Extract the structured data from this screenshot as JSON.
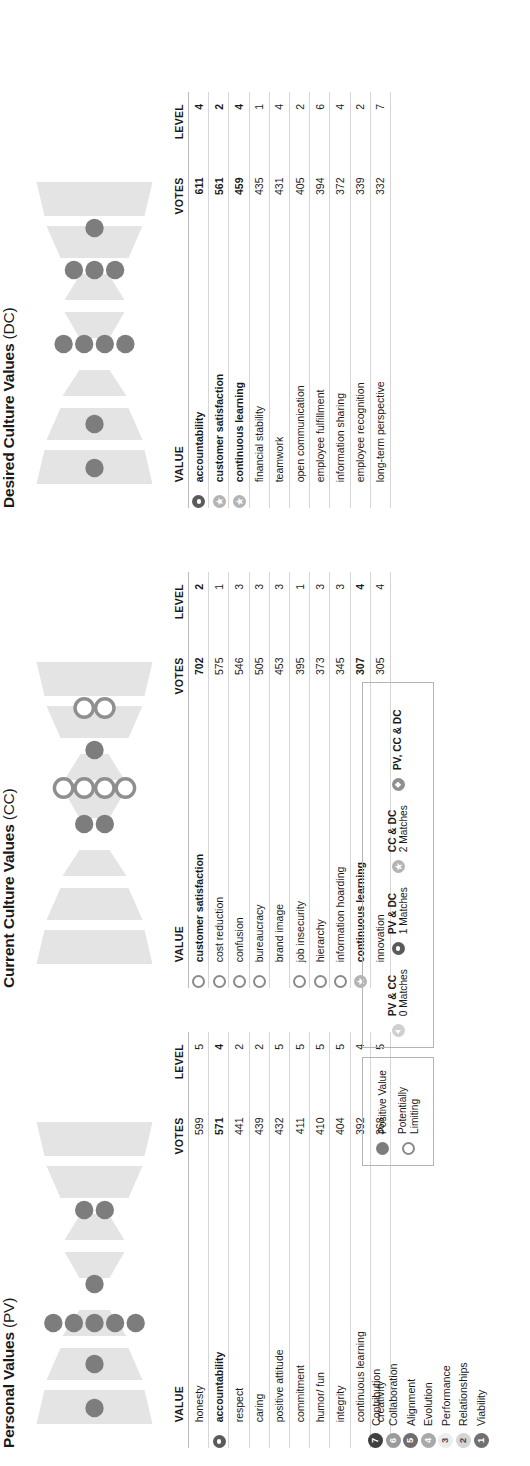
{
  "report": {
    "panels": [
      {
        "key": "pv",
        "title": "Personal Values",
        "suffix": " (PV)",
        "columns": {
          "value": "VALUE",
          "votes": "VOTES",
          "level": "LEVEL"
        },
        "rows": [
          {
            "icon": "",
            "value": "honesty",
            "votes": "599",
            "level": "5",
            "bold": false
          },
          {
            "icon": "m-pvdc",
            "value": "accountability",
            "votes": "571",
            "level": "4",
            "bold": true
          },
          {
            "icon": "",
            "value": "respect",
            "votes": "441",
            "level": "2",
            "bold": false
          },
          {
            "icon": "",
            "value": "caring",
            "votes": "439",
            "level": "2",
            "bold": false
          },
          {
            "icon": "",
            "value": "positive attitude",
            "votes": "432",
            "level": "5",
            "bold": false
          },
          {
            "icon": "",
            "value": "commitment",
            "votes": "411",
            "level": "5",
            "bold": false
          },
          {
            "icon": "",
            "value": "humor/ fun",
            "votes": "410",
            "level": "5",
            "bold": false
          },
          {
            "icon": "",
            "value": "integrity",
            "votes": "404",
            "level": "5",
            "bold": false
          },
          {
            "icon": "",
            "value": "continuous learning",
            "votes": "392",
            "level": "4",
            "bold": false
          },
          {
            "icon": "",
            "value": "creativity",
            "votes": "368",
            "level": "5",
            "bold": false
          }
        ],
        "hourglass": {
          "levels": [
            {
              "level": 7,
              "pv": 1,
              "type": "pos"
            },
            {
              "level": 6,
              "pv": 1,
              "type": "pos"
            },
            {
              "level": 5,
              "pv": 5,
              "type": "pos"
            },
            {
              "level": 4,
              "pv": 1,
              "type": "pos"
            },
            {
              "level": 3,
              "pv": 0,
              "type": "pos"
            },
            {
              "level": 2,
              "pv": 2,
              "type": "pos"
            },
            {
              "level": 1,
              "pv": 0,
              "type": "pos"
            }
          ]
        }
      },
      {
        "key": "cc",
        "title": "Current Culture Values",
        "suffix": " (CC)",
        "columns": {
          "value": "VALUE",
          "votes": "VOTES",
          "level": "LEVEL"
        },
        "rows": [
          {
            "icon": "pl",
            "value": "customer satisfaction",
            "votes": "702",
            "level": "2",
            "bold": true
          },
          {
            "icon": "pl",
            "value": "cost reduction",
            "votes": "575",
            "level": "1",
            "bold": false
          },
          {
            "icon": "pl",
            "value": "confusion",
            "votes": "546",
            "level": "3",
            "bold": false
          },
          {
            "icon": "pl",
            "value": "bureaucracy",
            "votes": "505",
            "level": "3",
            "bold": false
          },
          {
            "icon": "",
            "value": "brand image",
            "votes": "453",
            "level": "3",
            "bold": false
          },
          {
            "icon": "pl",
            "value": "job insecurity",
            "votes": "395",
            "level": "1",
            "bold": false
          },
          {
            "icon": "pl",
            "value": "hierarchy",
            "votes": "373",
            "level": "3",
            "bold": false
          },
          {
            "icon": "pl",
            "value": "information hoarding",
            "votes": "345",
            "level": "3",
            "bold": false
          },
          {
            "icon": "m-ccdc",
            "value": "continuous learning",
            "votes": "307",
            "level": "4",
            "bold": true
          },
          {
            "icon": "",
            "value": "innovation",
            "votes": "305",
            "level": "4",
            "bold": false
          }
        ],
        "hourglass": {
          "levels": [
            {
              "level": 7,
              "pv": 0,
              "type": "pos"
            },
            {
              "level": 6,
              "pv": 0,
              "type": "pos"
            },
            {
              "level": 5,
              "pv": 0,
              "type": "pos"
            },
            {
              "level": 4,
              "pv": 2,
              "type": "pos"
            },
            {
              "level": 3,
              "pv": 4,
              "type": "pl"
            },
            {
              "level": 2,
              "pv": 1,
              "type": "pos"
            },
            {
              "level": 1,
              "pv": 2,
              "type": "pl"
            }
          ]
        }
      },
      {
        "key": "dc",
        "title": "Desired Culture Values",
        "suffix": " (DC)",
        "columns": {
          "value": "VALUE",
          "votes": "VOTES",
          "level": "LEVEL"
        },
        "rows": [
          {
            "icon": "m-pvdc",
            "value": "accountability",
            "votes": "611",
            "level": "4",
            "bold": true
          },
          {
            "icon": "m-ccdc",
            "value": "customer satisfaction",
            "votes": "561",
            "level": "2",
            "bold": true
          },
          {
            "icon": "m-ccdc",
            "value": "continuous learning",
            "votes": "459",
            "level": "4",
            "bold": true
          },
          {
            "icon": "",
            "value": "financial stability",
            "votes": "435",
            "level": "1",
            "bold": false
          },
          {
            "icon": "",
            "value": "teamwork",
            "votes": "431",
            "level": "4",
            "bold": false
          },
          {
            "icon": "",
            "value": "open communication",
            "votes": "405",
            "level": "2",
            "bold": false
          },
          {
            "icon": "",
            "value": "employee fulfillment",
            "votes": "394",
            "level": "6",
            "bold": false
          },
          {
            "icon": "",
            "value": "information sharing",
            "votes": "372",
            "level": "4",
            "bold": false
          },
          {
            "icon": "",
            "value": "employee recognition",
            "votes": "339",
            "level": "2",
            "bold": false
          },
          {
            "icon": "",
            "value": "long-term perspective",
            "votes": "332",
            "level": "7",
            "bold": false
          }
        ],
        "hourglass": {
          "levels": [
            {
              "level": 7,
              "pv": 1,
              "type": "pos"
            },
            {
              "level": 6,
              "pv": 1,
              "type": "pos"
            },
            {
              "level": 5,
              "pv": 0,
              "type": "pos"
            },
            {
              "level": 4,
              "pv": 4,
              "type": "pos"
            },
            {
              "level": 3,
              "pv": 0,
              "type": "pos"
            },
            {
              "level": 2,
              "pv": 3,
              "type": "pos"
            },
            {
              "level": 1,
              "pv": 1,
              "type": "pos"
            }
          ]
        }
      }
    ],
    "levels_legend": [
      {
        "num": "7",
        "label": "Contribution",
        "color": "#3f3f3f"
      },
      {
        "num": "6",
        "label": "Collaboration",
        "color": "#9a9a9a"
      },
      {
        "num": "5",
        "label": "Alignment",
        "color": "#6e6e6e"
      },
      {
        "num": "4",
        "label": "Evolution",
        "color": "#a9a9a9"
      },
      {
        "num": "3",
        "label": "Performance",
        "color": "#ededed"
      },
      {
        "num": "2",
        "label": "Relationships",
        "color": "#d5d5d5"
      },
      {
        "num": "1",
        "label": "Viability",
        "color": "#707070"
      }
    ],
    "value_legend": [
      {
        "icon": "pos",
        "title": "Positive Value",
        "sub": ""
      },
      {
        "icon": "pl",
        "title": "Potentially",
        "sub": "Limiting"
      }
    ],
    "match_legend": [
      {
        "icon": "m-pvcc",
        "title": "PV & CC",
        "sub": "0 Matches"
      },
      {
        "icon": "m-pvdc",
        "title": "PV & DC",
        "sub": "1 Matches"
      },
      {
        "icon": "m-ccdc",
        "title": "CC & DC",
        "sub": "2 Matches"
      },
      {
        "icon": "m-all",
        "title": "PV, CC & DC",
        "sub": ""
      }
    ]
  },
  "colors": {
    "dot_positive": "#7d7d7d",
    "dot_limiting_stroke": "#8a8a8a",
    "wedge": "#e2e2e2",
    "rule": "#d6d6d6"
  }
}
